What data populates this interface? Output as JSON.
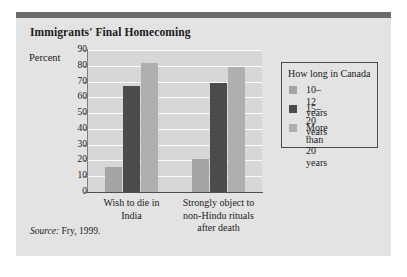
{
  "figure": {
    "title": "Immigrants' Final Homecoming",
    "source_label": "Source:",
    "source_text": " Fry, 1999."
  },
  "legend": {
    "title": "How long in Canada",
    "items": [
      {
        "label": "10–12 years",
        "color": "#a5a5a5"
      },
      {
        "label": "15–20 years",
        "color": "#4b4b4b"
      },
      {
        "label": "More than\n20 years",
        "color": "#afafaf"
      }
    ]
  },
  "chart_data": {
    "type": "bar",
    "title": "Immigrants' Final Homecoming",
    "xlabel": "",
    "ylabel": "Percent",
    "ylim": [
      0,
      90
    ],
    "yticks": [
      0,
      10,
      20,
      30,
      40,
      50,
      60,
      70,
      80,
      90
    ],
    "ytick_labels": [
      "0",
      "10",
      "20",
      "30",
      "40",
      "50",
      "60",
      "70",
      "80",
      "90"
    ],
    "grid": true,
    "legend_position": "right",
    "categories": [
      "Wish to die in\nIndia",
      "Strongly object to\nnon-Hindu rituals\nafter death"
    ],
    "series": [
      {
        "name": "10–12 years",
        "color": "#a5a5a5",
        "values": [
          16,
          21
        ]
      },
      {
        "name": "15–20 years",
        "color": "#4b4b4b",
        "values": [
          67,
          69
        ]
      },
      {
        "name": "More than 20 years",
        "color": "#afafaf",
        "values": [
          82,
          79
        ]
      }
    ]
  }
}
